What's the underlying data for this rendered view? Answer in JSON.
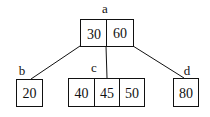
{
  "diagram": {
    "type": "b-tree",
    "nodes": [
      {
        "id": "a",
        "label": "a",
        "keys": [
          "30",
          "60"
        ]
      },
      {
        "id": "b",
        "label": "b",
        "keys": [
          "20"
        ]
      },
      {
        "id": "c",
        "label": "c",
        "keys": [
          "40",
          "45",
          "50"
        ]
      },
      {
        "id": "d",
        "label": "d",
        "keys": [
          "80"
        ]
      }
    ],
    "edges": [
      {
        "from": "a",
        "to": "b"
      },
      {
        "from": "a",
        "to": "c"
      },
      {
        "from": "a",
        "to": "d"
      }
    ]
  }
}
